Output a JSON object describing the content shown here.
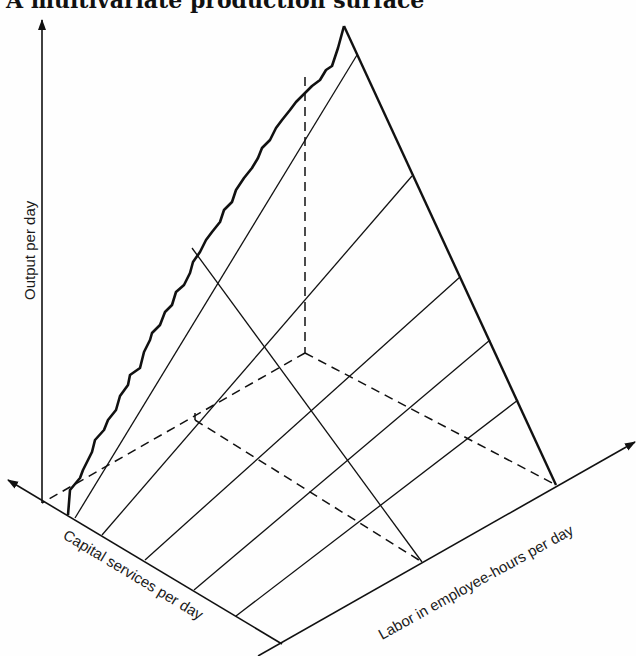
{
  "title": "A multivariate production surface",
  "axes": {
    "output": {
      "label": "Output per day",
      "from": [
        42,
        503
      ],
      "to": [
        42,
        20
      ]
    },
    "capital": {
      "label": "Capital services per day",
      "from": [
        282,
        644
      ],
      "to": [
        8,
        480
      ]
    },
    "labor": {
      "label": "Labor in employee-hours per day",
      "from": [
        258,
        656
      ],
      "to": [
        635,
        442
      ]
    }
  },
  "labels": {
    "output": {
      "x": 35,
      "y": 300,
      "rotate": -90
    },
    "capital": {
      "x": 62,
      "y": 538,
      "rotate": 31
    },
    "labor": {
      "x": 382,
      "y": 640,
      "rotate": -29
    }
  },
  "surface": {
    "peak": [
      344,
      26
    ],
    "right_edge_base": [
      556,
      485
    ],
    "left_edge_base": [
      68,
      515
    ],
    "wavy_edge": [
      [
        68,
        515
      ],
      [
        70,
        490
      ],
      [
        80,
        478
      ],
      [
        83,
        470
      ],
      [
        92,
        452
      ],
      [
        95,
        440
      ],
      [
        104,
        430
      ],
      [
        108,
        420
      ],
      [
        116,
        410
      ],
      [
        120,
        396
      ],
      [
        128,
        385
      ],
      [
        130,
        375
      ],
      [
        140,
        368
      ],
      [
        144,
        352
      ],
      [
        150,
        340
      ],
      [
        152,
        333
      ],
      [
        160,
        325
      ],
      [
        165,
        312
      ],
      [
        172,
        305
      ],
      [
        176,
        292
      ],
      [
        184,
        285
      ],
      [
        190,
        273
      ],
      [
        193,
        262
      ],
      [
        200,
        252
      ],
      [
        206,
        240
      ],
      [
        212,
        232
      ],
      [
        220,
        222
      ],
      [
        224,
        210
      ],
      [
        232,
        202
      ],
      [
        236,
        190
      ],
      [
        244,
        178
      ],
      [
        252,
        168
      ],
      [
        258,
        158
      ],
      [
        262,
        148
      ],
      [
        270,
        140
      ],
      [
        276,
        128
      ],
      [
        282,
        120
      ],
      [
        290,
        110
      ],
      [
        296,
        102
      ],
      [
        302,
        96
      ],
      [
        312,
        86
      ],
      [
        320,
        80
      ],
      [
        326,
        70
      ],
      [
        332,
        66
      ],
      [
        338,
        48
      ],
      [
        344,
        26
      ]
    ],
    "fan_lines": [
      [
        [
          75,
          518
        ],
        [
          357,
          55
        ]
      ],
      [
        [
          102,
          535
        ],
        [
          412,
          176
        ]
      ],
      [
        [
          145,
          560
        ],
        [
          460,
          277
        ]
      ],
      [
        [
          194,
          590
        ],
        [
          490,
          340
        ]
      ],
      [
        [
          236,
          616
        ],
        [
          518,
          400
        ]
      ]
    ],
    "transverse_line": [
      [
        192,
        248
      ],
      [
        422,
        562
      ]
    ],
    "dashed_lines": [
      [
        [
          305,
          77
        ],
        [
          305,
          353
        ]
      ],
      [
        [
          305,
          353
        ],
        [
          42,
          503
        ]
      ],
      [
        [
          305,
          353
        ],
        [
          556,
          485
        ]
      ],
      [
        [
          195,
          420
        ],
        [
          422,
          562
        ]
      ],
      [
        [
          195,
          420
        ],
        [
          195,
          413
        ]
      ]
    ]
  }
}
